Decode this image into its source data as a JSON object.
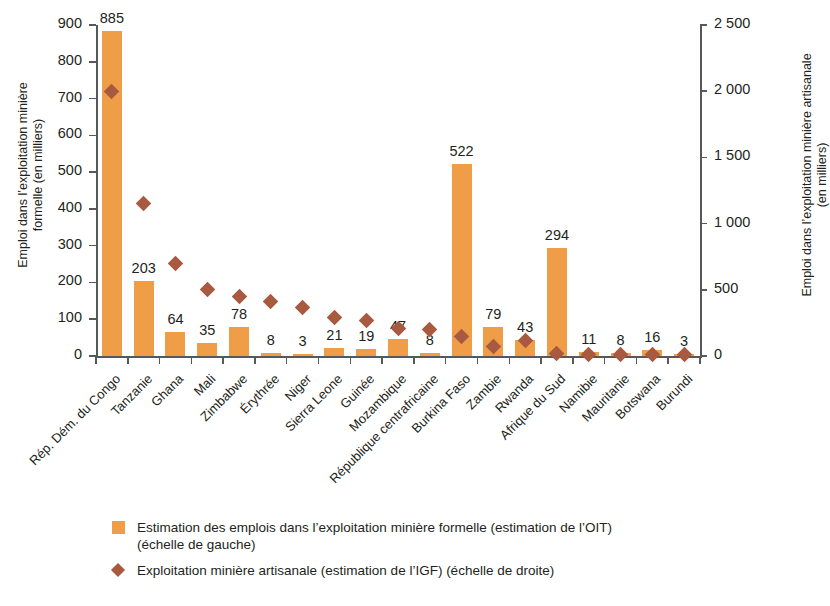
{
  "chart_data": {
    "type": "bar",
    "title": "",
    "subtitle": "",
    "categories": [
      "Rép. Dém. du Congo",
      "Tanzanie",
      "Ghana",
      "Mali",
      "Zimbabwe",
      "Érythrée",
      "Niger",
      "Sierra Leone",
      "Guinée",
      "Mozambique",
      "République centrafricaine",
      "Burkina Faso",
      "Zambie",
      "Rwanda",
      "Afrique du Sud",
      "Namibie",
      "Mauritanie",
      "Botswana",
      "Burundi"
    ],
    "series": [
      {
        "name": "Estimation des emplois dans l’exploitation minière formelle (estimation de l’OIT) (échelle de gauche)",
        "type": "bar",
        "axis": "left",
        "color": "#ef9d46",
        "values": [
          885,
          203,
          64,
          35,
          78,
          8,
          3,
          21,
          19,
          47,
          8,
          522,
          79,
          43,
          294,
          11,
          8,
          16,
          3
        ],
        "labels": [
          "885",
          "203",
          "64",
          "35",
          "78",
          "8",
          "3",
          "21",
          "19",
          "47",
          "8",
          "522",
          "79",
          "43",
          "294",
          "11",
          "8",
          "16",
          "3"
        ]
      },
      {
        "name": "Exploitation minière artisanale (estimation de l’IGF) (échelle de droite)",
        "type": "scatter",
        "axis": "right",
        "color": "#a85a41",
        "marker": "diamond",
        "values": [
          2000,
          1150,
          700,
          500,
          450,
          410,
          370,
          290,
          265,
          210,
          200,
          150,
          70,
          120,
          20,
          15,
          15,
          15,
          10
        ]
      }
    ],
    "xlabel": "",
    "ylabel": "Emploi dans l’exploitation minière formelle (en milliers)",
    "y2label": "Emploi dans l’exploitation minière artisanale (en milliers)",
    "ylim": [
      0,
      900
    ],
    "yticks": [
      0,
      100,
      200,
      300,
      400,
      500,
      600,
      700,
      800,
      900
    ],
    "ytick_labels": [
      "0",
      "100",
      "200",
      "300",
      "400",
      "500",
      "600",
      "700",
      "800",
      "900"
    ],
    "y2lim": [
      0,
      2500
    ],
    "y2ticks": [
      0,
      500,
      1000,
      1500,
      2000,
      2500
    ],
    "y2tick_labels": [
      "0",
      "500",
      "1 000",
      "1 500",
      "2 000",
      "2 500"
    ],
    "grid": false,
    "legend_position": "bottom-left"
  },
  "legend": {
    "items": [
      {
        "marker": "bar-swatch",
        "line1": "Estimation des emplois dans l’exploitation minière formelle (estimation de l’OIT)",
        "line2": "(échelle de gauche)"
      },
      {
        "marker": "diamond-swatch",
        "line1": "Exploitation minière artisanale (estimation de l’IGF) (échelle de droite)",
        "line2": ""
      }
    ]
  }
}
